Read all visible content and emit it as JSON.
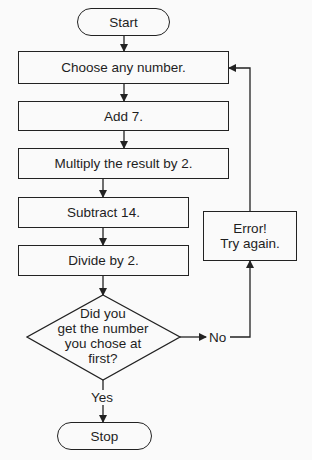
{
  "flowchart": {
    "start": {
      "label": "Start"
    },
    "steps": [
      {
        "label": "Choose any number."
      },
      {
        "label": "Add 7."
      },
      {
        "label": "Multiply the result by 2."
      },
      {
        "label": "Subtract 14."
      },
      {
        "label": "Divide by 2."
      }
    ],
    "decision": {
      "lines": [
        "Did you",
        "get the number",
        "you chose at",
        "first?"
      ],
      "yes_label": "Yes",
      "no_label": "No"
    },
    "error": {
      "lines": [
        "Error!",
        "Try again."
      ]
    },
    "stop": {
      "label": "Stop"
    }
  },
  "colors": {
    "background": "#fafafa",
    "line": "#222222",
    "text": "#1e1e1e"
  }
}
